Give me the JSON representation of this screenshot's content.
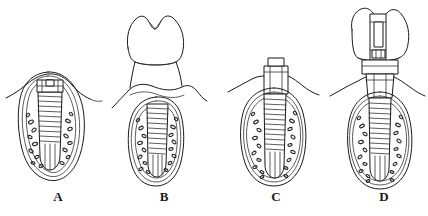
{
  "figure": {
    "type": "line-drawing",
    "background_color": "#ffffff",
    "line_color": "#1a1a1a",
    "width": 428,
    "height": 216,
    "panel_count": 4
  },
  "panels": [
    {
      "id": "a",
      "label": "A",
      "description": "Submerged implant in alveolar bone with cover screw, mucosa closed over it",
      "components": [
        "alveolar-bone-outline",
        "cortical-bone-line",
        "trabecular-bone-stipple",
        "threaded-implant-body",
        "cover-screw",
        "gingival-mucosa-line"
      ]
    },
    {
      "id": "b",
      "label": "B",
      "description": "Opposing molar tooth above submerged implant site in bone",
      "components": [
        "opposing-molar-crown",
        "molar-roots",
        "alveolar-bone-outline",
        "trabecular-bone-stipple",
        "threaded-implant-body",
        "gingival-mucosa-line"
      ]
    },
    {
      "id": "c",
      "label": "C",
      "description": "Second stage surgery, healing abutment emerging through gingiva",
      "components": [
        "alveolar-bone-outline",
        "trabecular-bone-stipple",
        "threaded-implant-body",
        "healing-abutment",
        "abutment-cap",
        "gingival-mucosa-line"
      ]
    },
    {
      "id": "d",
      "label": "D",
      "description": "Definitive restoration, crown on abutment secured by retaining screw into implant",
      "components": [
        "prosthetic-crown",
        "screw-access-channel",
        "retaining-screw",
        "transmucosal-abutment",
        "threaded-implant-body",
        "alveolar-bone-outline",
        "trabecular-bone-stipple",
        "gingival-mucosa-line"
      ]
    }
  ],
  "labels": {
    "a": "A",
    "b": "B",
    "c": "C",
    "d": "D"
  },
  "caption": {
    "partial_text": ""
  }
}
